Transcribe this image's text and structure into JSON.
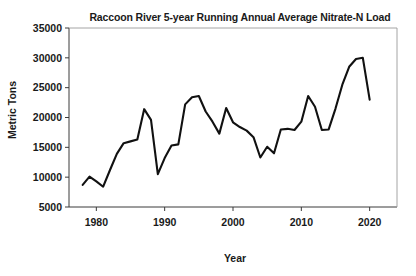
{
  "chart_data": {
    "type": "line",
    "title": "Raccoon River 5-year Running Annual Average Nitrate-N Load",
    "xlabel": "Year",
    "ylabel": "Metric Tons",
    "xlim": [
      1976,
      2024
    ],
    "ylim": [
      5000,
      35000
    ],
    "xticks": [
      1980,
      1990,
      2000,
      2010,
      2020
    ],
    "xtick_labels": [
      "1980",
      "1990",
      "2000",
      "2010",
      "2020"
    ],
    "yticks": [
      5000,
      10000,
      15000,
      20000,
      25000,
      30000,
      35000
    ],
    "ytick_labels": [
      "5000",
      "10000",
      "15000",
      "20000",
      "25000",
      "30000",
      "35000"
    ],
    "grid": false,
    "legend": false,
    "line_color": "#111111",
    "series": [
      {
        "name": "5-year Running Annual Average Nitrate-N Load",
        "x": [
          1978,
          1979,
          1980,
          1981,
          1982,
          1983,
          1984,
          1985,
          1986,
          1987,
          1988,
          1989,
          1990,
          1991,
          1992,
          1993,
          1994,
          1995,
          1996,
          1997,
          1998,
          1999,
          2000,
          2001,
          2002,
          2003,
          2004,
          2005,
          2006,
          2007,
          2008,
          2009,
          2010,
          2011,
          2012,
          2013,
          2014,
          2015,
          2016,
          2017,
          2018,
          2019,
          2020
        ],
        "values": [
          8700,
          10100,
          9300,
          8400,
          11200,
          13900,
          15700,
          16000,
          16300,
          21400,
          19600,
          10500,
          13200,
          15300,
          15500,
          22200,
          23400,
          23600,
          21000,
          19300,
          17300,
          21600,
          19200,
          18400,
          17800,
          16700,
          13300,
          15100,
          14000,
          18000,
          18100,
          17900,
          19300,
          23600,
          21800,
          17900,
          18000,
          21500,
          25500,
          28500,
          29800,
          30000,
          23000
        ]
      }
    ]
  }
}
